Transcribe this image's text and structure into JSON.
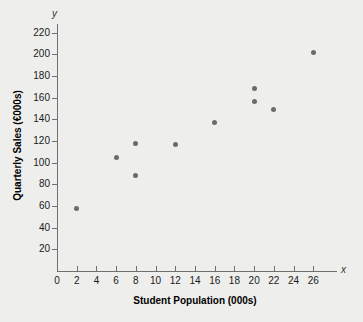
{
  "chart_data": {
    "type": "scatter",
    "title": "",
    "xlabel": "Student Population (000s)",
    "ylabel": "Quarterly Sales (€000s)",
    "axis_name_x": "x",
    "axis_name_y": "y",
    "xlim": [
      0,
      28
    ],
    "ylim": [
      0,
      230
    ],
    "xticks": [
      0,
      2,
      4,
      6,
      8,
      10,
      12,
      14,
      16,
      18,
      20,
      22,
      24,
      26
    ],
    "yticks": [
      20,
      40,
      60,
      80,
      100,
      120,
      140,
      160,
      180,
      200,
      220
    ],
    "xtick_labels": [
      "0",
      "2",
      "4",
      "6",
      "8",
      "10",
      "12",
      "14",
      "16",
      "18",
      "20",
      "22",
      "24",
      "26"
    ],
    "ytick_labels": [
      "20",
      "40",
      "60",
      "80",
      "100",
      "120",
      "140",
      "160",
      "180",
      "200",
      "220"
    ],
    "grid": false,
    "legend": false,
    "marker_color": "#6b6b6b",
    "axis_color": "#6f6f6f",
    "background": "#eeeeec",
    "points": [
      {
        "x": 2,
        "y": 58
      },
      {
        "x": 6,
        "y": 105
      },
      {
        "x": 8,
        "y": 88
      },
      {
        "x": 8,
        "y": 118
      },
      {
        "x": 12,
        "y": 117
      },
      {
        "x": 16,
        "y": 137
      },
      {
        "x": 20,
        "y": 157
      },
      {
        "x": 20,
        "y": 169
      },
      {
        "x": 22,
        "y": 149
      },
      {
        "x": 26,
        "y": 202
      }
    ]
  }
}
